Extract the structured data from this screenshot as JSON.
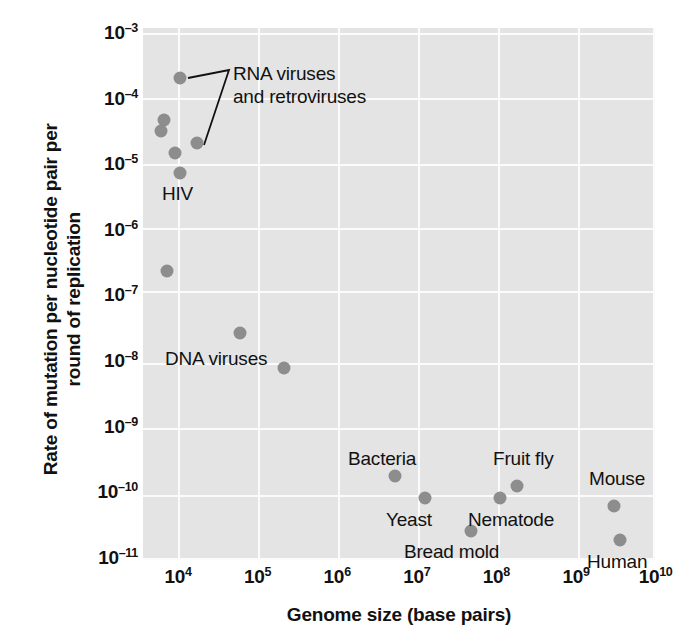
{
  "chart_data": {
    "type": "scatter",
    "title": "",
    "xlabel": "Genome size (base pairs)",
    "ylabel": "Rate of mutation per nucleotide pair per round of replication",
    "ylabel_lines": [
      "Rate of mutation per nucleotide pair per",
      "round of replication"
    ],
    "xscale": "log",
    "yscale": "log",
    "xlim": [
      3000,
      10000000000
    ],
    "ylim": [
      1e-11,
      0.001
    ],
    "grid": true,
    "legend": "none",
    "xticks": [
      {
        "label": "10",
        "exp": "4",
        "value": 10000
      },
      {
        "label": "10",
        "exp": "5",
        "value": 100000
      },
      {
        "label": "10",
        "exp": "6",
        "value": 1000000
      },
      {
        "label": "10",
        "exp": "7",
        "value": 10000000
      },
      {
        "label": "10",
        "exp": "8",
        "value": 100000000
      },
      {
        "label": "10",
        "exp": "9",
        "value": 1000000000
      },
      {
        "label": "10",
        "exp": "10",
        "value": 10000000000
      }
    ],
    "yticks": [
      {
        "label": "10",
        "exp": "–3",
        "value": 0.001
      },
      {
        "label": "10",
        "exp": "–4",
        "value": 0.0001
      },
      {
        "label": "10",
        "exp": "–5",
        "value": 1e-05
      },
      {
        "label": "10",
        "exp": "–6",
        "value": 1e-06
      },
      {
        "label": "10",
        "exp": "–7",
        "value": 1e-07
      },
      {
        "label": "10",
        "exp": "–8",
        "value": 1e-08
      },
      {
        "label": "10",
        "exp": "–9",
        "value": 1e-09
      },
      {
        "label": "10",
        "exp": "–10",
        "value": 1e-10
      },
      {
        "label": "10",
        "exp": "–11",
        "value": 1e-11
      }
    ],
    "points": [
      {
        "name": "RNA virus 1",
        "group": "RNA viruses and retroviruses",
        "x": 9000,
        "y": 0.00028,
        "px": 37,
        "py": 50
      },
      {
        "name": "RNA virus 2",
        "group": "RNA viruses and retroviruses",
        "x": 6200,
        "y": 0.0001,
        "px": 21,
        "py": 92
      },
      {
        "name": "RNA virus 3",
        "group": "RNA viruses and retroviruses",
        "x": 5800,
        "y": 7.8e-05,
        "px": 18,
        "py": 103
      },
      {
        "name": "RNA virus 4",
        "group": "RNA viruses and retroviruses",
        "x": 13000,
        "y": 5e-05,
        "px": 54,
        "py": 115
      },
      {
        "name": "RNA virus 5",
        "group": "RNA viruses and retroviruses",
        "x": 8000,
        "y": 3.6e-05,
        "px": 32,
        "py": 125
      },
      {
        "name": "HIV",
        "group": "RNA viruses and retroviruses",
        "x": 9500,
        "y": 1.9e-05,
        "px": 37,
        "py": 145
      },
      {
        "name": "DNA virus 1",
        "group": "DNA viruses",
        "x": 5800,
        "y": 6.2e-07,
        "px": 24,
        "py": 243
      },
      {
        "name": "DNA virus 2",
        "group": "DNA viruses",
        "x": 48000,
        "y": 7.2e-08,
        "px": 97,
        "py": 305
      },
      {
        "name": "DNA virus 3",
        "group": "DNA viruses",
        "x": 170000,
        "y": 2.3e-08,
        "px": 141,
        "py": 340
      },
      {
        "name": "Bacteria",
        "group": "organisms",
        "x": 4600000,
        "y": 5e-10,
        "px": 252,
        "py": 448
      },
      {
        "name": "Yeast",
        "group": "organisms",
        "x": 12000000,
        "y": 2.2e-10,
        "px": 282,
        "py": 470
      },
      {
        "name": "Bread mold",
        "group": "organisms",
        "x": 40000000,
        "y": 7e-11,
        "px": 328,
        "py": 503
      },
      {
        "name": "Nematode",
        "group": "organisms",
        "x": 100000000,
        "y": 2.3e-10,
        "px": 357,
        "py": 470
      },
      {
        "name": "Fruit fly",
        "group": "organisms",
        "x": 180000000,
        "y": 3.2e-10,
        "px": 374,
        "py": 458
      },
      {
        "name": "Mouse",
        "group": "organisms",
        "x": 2700000000,
        "y": 1.8e-10,
        "px": 471,
        "py": 478
      },
      {
        "name": "Human",
        "group": "organisms",
        "x": 3100000000,
        "y": 5.5e-11,
        "px": 477,
        "py": 512
      }
    ],
    "annotations": [
      {
        "id": "rna-viruses",
        "text_lines": [
          "RNA viruses",
          "and retroviruses"
        ],
        "px": 90,
        "py": 35
      },
      {
        "id": "hiv",
        "text_lines": [
          "HIV"
        ],
        "px": 19,
        "py": 155
      },
      {
        "id": "dna-viruses",
        "text_lines": [
          "DNA viruses"
        ],
        "px": 22,
        "py": 320
      },
      {
        "id": "bacteria",
        "text_lines": [
          "Bacteria"
        ],
        "px": 205,
        "py": 420
      },
      {
        "id": "yeast",
        "text_lines": [
          "Yeast"
        ],
        "px": 243,
        "py": 481
      },
      {
        "id": "bread-mold",
        "text_lines": [
          "Bread mold"
        ],
        "px": 261,
        "py": 513
      },
      {
        "id": "nematode",
        "text_lines": [
          "Nematode"
        ],
        "px": 325,
        "py": 481
      },
      {
        "id": "fruit-fly",
        "text_lines": [
          "Fruit fly"
        ],
        "px": 350,
        "py": 420
      },
      {
        "id": "mouse",
        "text_lines": [
          "Mouse"
        ],
        "px": 446,
        "py": 440
      },
      {
        "id": "human",
        "text_lines": [
          "Human"
        ],
        "px": 444,
        "py": 523
      }
    ],
    "colors": {
      "plot_background": "#e4e4e4",
      "gridline": "#fbfbfb",
      "point": "#8d8d8d",
      "text": "#111111",
      "page_background": "#ffffff"
    }
  }
}
